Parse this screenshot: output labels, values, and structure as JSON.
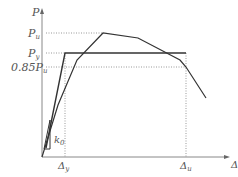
{
  "diagram": {
    "type": "load-displacement curve",
    "y_axis_label": "P",
    "x_axis_label": "Δ",
    "y_labels": {
      "pu": "P",
      "pu_sub": "u",
      "py": "P",
      "py_sub": "y",
      "p085": "0.85P",
      "p085_sub": "u"
    },
    "x_labels": {
      "dy": "Δ",
      "dy_sub": "y",
      "du": "Δ",
      "du_sub": "u"
    },
    "stiffness_label": "k",
    "stiffness_sub": "0",
    "colors": {
      "curve": "#333333",
      "axis": "#888888",
      "guide": "#999999"
    }
  }
}
